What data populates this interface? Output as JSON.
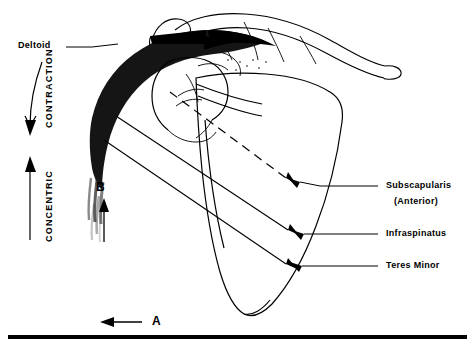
{
  "figure": {
    "title": "",
    "labels": {
      "deltoid": "Deltoid",
      "contraction": "CONTRACTION",
      "concentric": "CONCENTRIC",
      "point_b": "B",
      "point_a": "A",
      "subscapularis": "Subscapularis",
      "subscapularis_sub": "(Anterior)",
      "infraspinatus": "Infraspinatus",
      "teres_minor": "Teres Minor"
    },
    "colors": {
      "ink": "#000000",
      "muscle_fill": "#1a1a1a",
      "background": "#ffffff"
    },
    "icons": {
      "arrow_down": "contraction-arrow-down-icon",
      "arrow_up": "concentric-arrow-up-icon",
      "arrow_b": "arrow-b-up-icon",
      "arrow_a": "arrow-a-left-icon",
      "pointer_subscapularis": "leader-line-subscapularis",
      "pointer_infraspinatus": "leader-line-infraspinatus",
      "pointer_teres_minor": "leader-line-teres-minor"
    }
  }
}
